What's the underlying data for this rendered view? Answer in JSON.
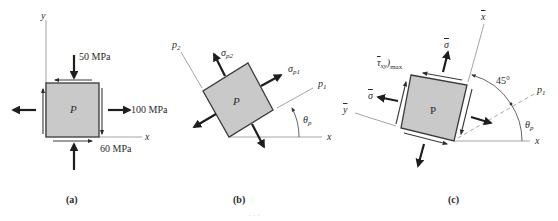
{
  "figure": {
    "panels": [
      {
        "id": "a",
        "caption": "(a)",
        "point_label": "P",
        "axes": {
          "x": "x",
          "y": "y"
        },
        "loads": {
          "sigma_y": "50 MPa",
          "sigma_x": "100 MPa",
          "tau_xy": "60 MPa"
        }
      },
      {
        "id": "b",
        "caption": "(b)",
        "point_label": "P",
        "axes": {
          "x": "x",
          "p1": "p",
          "p1_sub": "1",
          "p2": "p",
          "p2_sub": "2"
        },
        "stress_labels": {
          "sigma_p1": "σ",
          "sigma_p1_sub": "p1",
          "sigma_p2": "σ",
          "sigma_p2_sub": "p2"
        },
        "angle_label": "θ",
        "angle_sub": "p"
      },
      {
        "id": "c",
        "caption": "(c)",
        "point_label": "P",
        "axes": {
          "x": "x",
          "x_bar": "x",
          "y_bar": "y",
          "p1": "p",
          "p1_sub": "1"
        },
        "stress_labels": {
          "sigma_avg_top": "σ",
          "sigma_avg_left": "σ",
          "tau_max": "τ",
          "tau_max_sub": "xy",
          "tau_max_suffix": ")",
          "tau_max_sub2": "max"
        },
        "angle_45": "45°",
        "angle_label": "θ",
        "angle_sub": "p"
      }
    ],
    "footer_caption": "· · ·"
  },
  "colors": {
    "element_fill": "#c9c9c9",
    "element_stroke": "#3a3a3a",
    "arrow": "#1e1e1e",
    "axis": "#9a9a9a"
  }
}
